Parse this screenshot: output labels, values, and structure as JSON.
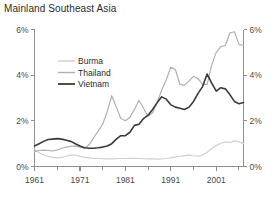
{
  "header": {
    "title": "Mainland Southeast Asia"
  },
  "chart_data": {
    "type": "line",
    "title": "Mainland Southeast Asia",
    "xlabel": "",
    "ylabel": "",
    "xlim": [
      1961,
      2007
    ],
    "ylim": [
      0,
      6
    ],
    "grid": false,
    "legend_position": "inside-upper-left",
    "y_tick_labels": [
      "0%",
      "2%",
      "4%",
      "6%"
    ],
    "y_tick_values": [
      0,
      2,
      4,
      6
    ],
    "y_axis_right_mirrored": true,
    "x_tick_labels": [
      "1961",
      "1971",
      "1981",
      "1991",
      "2001"
    ],
    "x_tick_values": [
      1961,
      1971,
      1981,
      1991,
      2001
    ],
    "x_minor_tick_values": [
      1966,
      1976,
      1986,
      1996,
      2006
    ],
    "x": [
      1961,
      1962,
      1963,
      1964,
      1965,
      1966,
      1967,
      1968,
      1969,
      1970,
      1971,
      1972,
      1973,
      1974,
      1975,
      1976,
      1977,
      1978,
      1979,
      1980,
      1981,
      1982,
      1983,
      1984,
      1985,
      1986,
      1987,
      1988,
      1989,
      1990,
      1991,
      1992,
      1993,
      1994,
      1995,
      1996,
      1997,
      1998,
      1999,
      2000,
      2001,
      2002,
      2003,
      2004,
      2005,
      2006,
      2007
    ],
    "series": [
      {
        "name": "Burma",
        "color": "#cfcfcf",
        "width": 1.2,
        "values": [
          0.75,
          0.6,
          0.5,
          0.45,
          0.4,
          0.38,
          0.4,
          0.45,
          0.5,
          0.5,
          0.45,
          0.4,
          0.38,
          0.35,
          0.35,
          0.34,
          0.33,
          0.33,
          0.34,
          0.35,
          0.35,
          0.36,
          0.36,
          0.35,
          0.34,
          0.33,
          0.33,
          0.32,
          0.33,
          0.35,
          0.38,
          0.42,
          0.45,
          0.48,
          0.5,
          0.47,
          0.45,
          0.5,
          0.62,
          0.78,
          0.92,
          1.02,
          1.08,
          1.05,
          1.12,
          1.08,
          1.0
        ]
      },
      {
        "name": "Thailand",
        "color": "#b0b0b0",
        "width": 1.2,
        "values": [
          0.65,
          0.7,
          0.72,
          0.7,
          0.68,
          0.72,
          0.8,
          0.85,
          0.88,
          0.9,
          0.85,
          0.8,
          0.95,
          1.25,
          1.55,
          1.85,
          2.4,
          3.1,
          2.6,
          2.1,
          2.0,
          2.15,
          2.5,
          2.9,
          2.55,
          2.2,
          2.35,
          2.8,
          3.35,
          3.8,
          4.35,
          4.25,
          3.6,
          3.55,
          3.75,
          3.95,
          3.85,
          3.6,
          3.6,
          4.45,
          5.0,
          5.25,
          5.3,
          5.85,
          5.9,
          5.35,
          5.3
        ]
      },
      {
        "name": "Vietnam",
        "color": "#3a3a3a",
        "width": 1.6,
        "values": [
          0.9,
          1.0,
          1.1,
          1.18,
          1.2,
          1.22,
          1.2,
          1.15,
          1.1,
          1.0,
          0.9,
          0.82,
          0.8,
          0.8,
          0.82,
          0.85,
          0.9,
          1.0,
          1.2,
          1.35,
          1.35,
          1.5,
          1.8,
          1.85,
          2.1,
          2.25,
          2.5,
          2.8,
          3.05,
          2.95,
          2.7,
          2.6,
          2.55,
          2.5,
          2.6,
          2.85,
          3.2,
          3.5,
          4.05,
          3.65,
          3.3,
          3.45,
          3.4,
          3.15,
          2.85,
          2.75,
          2.8
        ]
      }
    ]
  },
  "legend": {
    "items": [
      {
        "label": "Burma"
      },
      {
        "label": "Thailand"
      },
      {
        "label": "Vietnam"
      }
    ]
  }
}
